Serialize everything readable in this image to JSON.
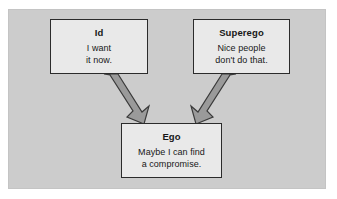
{
  "figure": {
    "caption": "Freudian personality structure diagram",
    "panel_background": "#cccccc",
    "outer_background": "#ffffff",
    "node_fill": "#e9e9e9",
    "node_border": "#2b2b2b",
    "arrow_fill": "#9a9a9a",
    "arrow_stroke": "#3a3a3a"
  },
  "nodes": [
    {
      "id": "id",
      "title": "Id",
      "line1": "I want",
      "line2": "it now."
    },
    {
      "id": "superego",
      "title": "Superego",
      "line1": "Nice people",
      "line2": "don't do that."
    },
    {
      "id": "ego",
      "title": "Ego",
      "line1": "Maybe I can find",
      "line2": "a compromise."
    }
  ],
  "arrows": [
    {
      "id": "id-to-ego",
      "from": "id",
      "to": "ego",
      "direction": "down-right"
    },
    {
      "id": "superego-to-ego",
      "from": "superego",
      "to": "ego",
      "direction": "down-left"
    }
  ]
}
